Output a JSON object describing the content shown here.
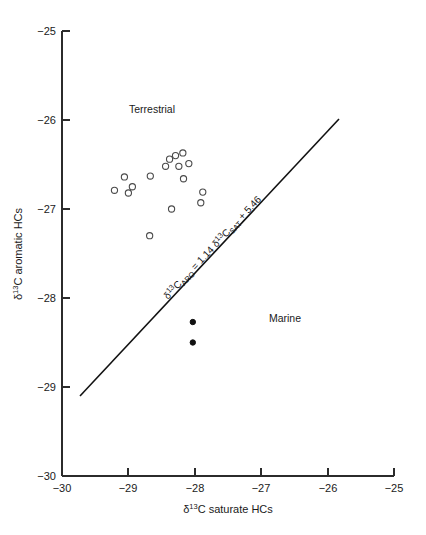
{
  "chart_data": {
    "type": "scatter",
    "title": "",
    "xlabel": "δ¹³C saturate HCs",
    "ylabel": "δ¹³C aromatic HCs",
    "xlim": [
      -30,
      -25
    ],
    "ylim": [
      -30,
      -25
    ],
    "xticks": [
      -30,
      -29,
      -28,
      -27,
      -26,
      -25
    ],
    "yticks": [
      -30,
      -29,
      -28,
      -27,
      -26,
      -25
    ],
    "xtick_labels": [
      "−30",
      "−29",
      "−28",
      "−27",
      "−26",
      "−25"
    ],
    "ytick_labels": [
      "−30",
      "−29",
      "−28",
      "−27",
      "−26",
      "−25"
    ],
    "grid": false,
    "legend_position": "none",
    "series": [
      {
        "name": "Terrestrial",
        "marker": "open-circle",
        "marker_color": "#4a4a4a",
        "points": [
          {
            "x": -29.06,
            "y": -26.64
          },
          {
            "x": -28.94,
            "y": -26.75
          },
          {
            "x": -29.21,
            "y": -26.79
          },
          {
            "x": -29.0,
            "y": -26.82
          },
          {
            "x": -28.67,
            "y": -26.63
          },
          {
            "x": -28.38,
            "y": -26.44
          },
          {
            "x": -28.29,
            "y": -26.4
          },
          {
            "x": -28.18,
            "y": -26.37
          },
          {
            "x": -28.44,
            "y": -26.52
          },
          {
            "x": -28.24,
            "y": -26.52
          },
          {
            "x": -28.09,
            "y": -26.49
          },
          {
            "x": -28.17,
            "y": -26.66
          },
          {
            "x": -27.88,
            "y": -26.81
          },
          {
            "x": -27.91,
            "y": -26.93
          },
          {
            "x": -28.35,
            "y": -27.0
          },
          {
            "x": -28.68,
            "y": -27.3
          }
        ]
      },
      {
        "name": "Marine",
        "marker": "filled-circle",
        "marker_color": "#111111",
        "points": [
          {
            "x": -28.03,
            "y": -28.27
          },
          {
            "x": -28.03,
            "y": -28.5
          }
        ]
      }
    ],
    "regression_line": {
      "label": "δ¹³C_ARO = 1.14 δ¹³C_SAT + 5.46",
      "slope": 1.14,
      "intercept": 5.46,
      "x_start": -29.73,
      "x_end": -25.82,
      "y_start": -29.02,
      "y_end": -25.99,
      "color": "#111111"
    },
    "annotations": [
      {
        "text": "Terrestrial",
        "x": -28.65,
        "y": -25.79,
        "name": "terrestrial-region-label"
      },
      {
        "text": "Marine",
        "x": -27.08,
        "y": -28.28,
        "name": "marine-region-label"
      }
    ]
  },
  "axis": {
    "x_title_main": "C saturate HCs",
    "x_title_delta": "δ",
    "x_title_sup": "13",
    "y_title_main": "C aromatic HCs",
    "y_title_delta": "δ",
    "y_title_sup": "13"
  },
  "equation": {
    "delta1": "δ",
    "sup1": "13",
    "c1": "C",
    "sub1": "ARO",
    "eq": " = 1.14 ",
    "delta2": "δ",
    "sup2": "13",
    "c2": "C",
    "sub2": "SAT",
    "tail": " + 5.46"
  },
  "labels": {
    "terrestrial": "Terrestrial",
    "marine": "Marine"
  },
  "ticks": {
    "x": [
      "−30",
      "−29",
      "−28",
      "−27",
      "−26",
      "−25"
    ],
    "y": [
      "−25",
      "−26",
      "−27",
      "−28",
      "−29",
      "−30"
    ]
  }
}
